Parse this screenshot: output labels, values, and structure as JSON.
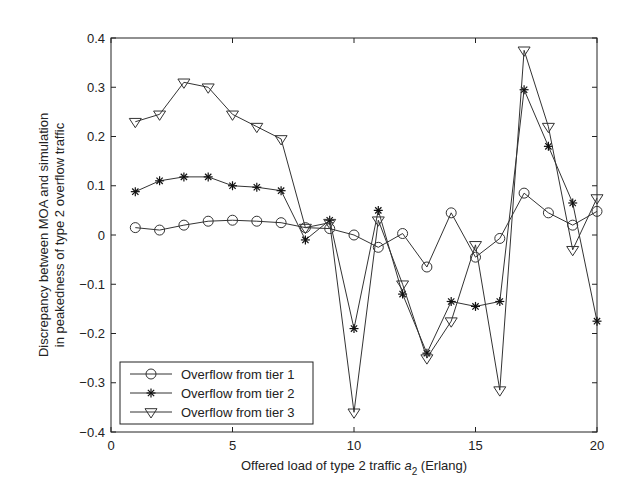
{
  "chart_data": {
    "type": "line",
    "title": "",
    "xlabel": "Offered load of type 2 traffic  a2 (Erlang)",
    "xlabel_parts": {
      "prefix": "Offered load of type 2 traffic  ",
      "var": "a",
      "sub": "2",
      "suffix": " (Erlang)"
    },
    "ylabel_line1": "Discrepancy between MOA and simulation",
    "ylabel_line2": "in peakedness of type 2 overflow traffic",
    "ylabel": "Discrepancy between MOA and simulation in peakedness of type 2 overflow traffic",
    "xlim": [
      0,
      20
    ],
    "ylim": [
      -0.4,
      0.4
    ],
    "xticks": [
      0,
      5,
      10,
      15,
      20
    ],
    "xtick_labels": [
      "0",
      "5",
      "10",
      "15",
      "20"
    ],
    "yticks": [
      -0.4,
      -0.3,
      -0.2,
      -0.1,
      0,
      0.1,
      0.2,
      0.3,
      0.4
    ],
    "ytick_labels": [
      "−0.4",
      "−0.3",
      "−0.2",
      "−0.1",
      "0",
      "0.1",
      "0.2",
      "0.3",
      "0.4"
    ],
    "grid": false,
    "legend_position": "lower left",
    "x": [
      1,
      2,
      3,
      4,
      5,
      6,
      7,
      8,
      9,
      10,
      11,
      12,
      13,
      14,
      15,
      16,
      17,
      18,
      19,
      20
    ],
    "series": [
      {
        "name": "Overflow from tier 1",
        "marker": "circle",
        "values": [
          0.015,
          0.01,
          0.02,
          0.028,
          0.03,
          0.028,
          0.025,
          0.015,
          0.013,
          0.0,
          -0.025,
          0.003,
          -0.065,
          0.045,
          -0.045,
          -0.007,
          0.085,
          0.045,
          0.02,
          0.048
        ]
      },
      {
        "name": "Overflow from tier 2",
        "marker": "star",
        "values": [
          0.088,
          0.11,
          0.118,
          0.118,
          0.1,
          0.097,
          0.09,
          -0.01,
          0.03,
          -0.19,
          0.05,
          -0.12,
          -0.24,
          -0.135,
          -0.145,
          -0.135,
          0.295,
          0.18,
          0.065,
          -0.175
        ]
      },
      {
        "name": "Overflow from tier 3",
        "marker": "triangle-down",
        "values": [
          0.23,
          0.245,
          0.31,
          0.3,
          0.245,
          0.22,
          0.195,
          0.015,
          0.025,
          -0.36,
          0.03,
          -0.1,
          -0.25,
          -0.175,
          -0.02,
          -0.315,
          0.375,
          0.22,
          -0.03,
          0.075
        ]
      }
    ]
  },
  "colors": {
    "line": "#333333",
    "axis": "#222222",
    "background": "#ffffff"
  }
}
